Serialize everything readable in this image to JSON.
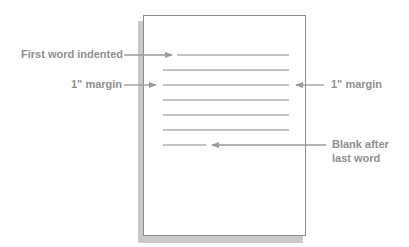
{
  "diagram": {
    "title": "",
    "labels": {
      "first_word_indented": "First word indented",
      "margin_left": "1\" margin",
      "margin_right": "1\" margin",
      "blank_after_line1": "Blank after",
      "blank_after_line2": "last word"
    },
    "page": {
      "text_lines": [
        {
          "y": 55,
          "x1": 177,
          "x2": 289,
          "type": "indented-first-line"
        },
        {
          "y": 70,
          "x1": 163,
          "x2": 289,
          "type": "full-line"
        },
        {
          "y": 85,
          "x1": 163,
          "x2": 289,
          "type": "full-line"
        },
        {
          "y": 100,
          "x1": 163,
          "x2": 289,
          "type": "full-line"
        },
        {
          "y": 115,
          "x1": 163,
          "x2": 289,
          "type": "full-line"
        },
        {
          "y": 130,
          "x1": 163,
          "x2": 289,
          "type": "full-line"
        },
        {
          "y": 145,
          "x1": 163,
          "x2": 206,
          "type": "short-last-line"
        }
      ]
    },
    "colors": {
      "label_text": "#8f8f8f",
      "arrow": "#9a9a9a",
      "text_line": "#8a8a8a",
      "page_border": "#8c8c8c",
      "shadow": "#c9c9c9"
    }
  }
}
